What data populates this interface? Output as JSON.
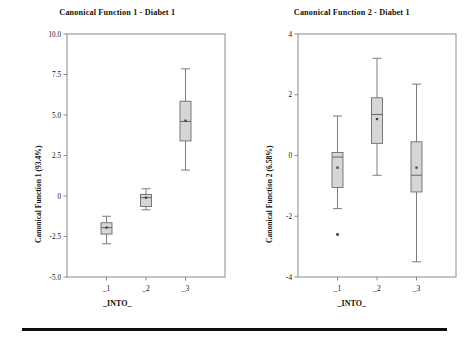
{
  "figure": {
    "footer_rule": "horizontal-rule"
  },
  "panels": [
    {
      "id": "panel-1",
      "title": "Canonical Function 1 - Diabet 1",
      "ylabel": "Canonical Function 1 (93.4%)",
      "xlabel": "_INTO_"
    },
    {
      "id": "panel-2",
      "title": "Canonical Function 2 - Diabet 1",
      "ylabel": "Canonical Function 2 (6.58%)",
      "xlabel": "_INTO_"
    }
  ],
  "chart_data": [
    {
      "type": "box",
      "title": "Canonical Function 1 - Diabet 1",
      "xlabel": "_INTO_",
      "ylabel": "Canonical Function 1 (93.4%)",
      "categories": [
        "_1",
        "_2",
        "_3"
      ],
      "ylim": [
        -5.0,
        10.0
      ],
      "yticks": [
        -5.0,
        -2.5,
        0,
        2.5,
        5.0,
        7.5,
        10.0
      ],
      "ytick_labels": [
        "-5.0",
        "-2.5",
        "0",
        "2.5",
        "5.0",
        "7.5",
        "10.0"
      ],
      "grid": false,
      "legend": "none",
      "boxes": [
        {
          "category": "_1",
          "whisker_low": -2.95,
          "q1": -2.35,
          "median": -1.95,
          "q3": -1.65,
          "whisker_high": -1.25,
          "mean": -1.95,
          "outliers": []
        },
        {
          "category": "_2",
          "whisker_low": -0.85,
          "q1": -0.65,
          "median": -0.1,
          "q3": 0.1,
          "whisker_high": 0.45,
          "mean": -0.1,
          "outliers": []
        },
        {
          "category": "_3",
          "whisker_low": 1.6,
          "q1": 3.4,
          "median": 4.6,
          "q3": 5.85,
          "whisker_high": 7.85,
          "mean": 4.65,
          "outliers": []
        }
      ]
    },
    {
      "type": "box",
      "title": "Canonical Function 2 - Diabet 1",
      "xlabel": "_INTO_",
      "ylabel": "Canonical Function 2 (6.58%)",
      "categories": [
        "_1",
        "_2",
        "_3"
      ],
      "ylim": [
        -4,
        4
      ],
      "yticks": [
        -4,
        -2,
        0,
        2,
        4
      ],
      "ytick_labels": [
        "-4",
        "-2",
        "0",
        "2",
        "4"
      ],
      "grid": false,
      "legend": "none",
      "boxes": [
        {
          "category": "_1",
          "whisker_low": -1.75,
          "q1": -1.05,
          "median": -0.05,
          "q3": 0.1,
          "whisker_high": 1.3,
          "mean": -0.4,
          "outliers": [
            -2.6
          ]
        },
        {
          "category": "_2",
          "whisker_low": -0.65,
          "q1": 0.4,
          "median": 1.35,
          "q3": 1.9,
          "whisker_high": 3.2,
          "mean": 1.2,
          "outliers": []
        },
        {
          "category": "_3",
          "whisker_low": -3.5,
          "q1": -1.2,
          "median": -0.65,
          "q3": 0.45,
          "whisker_high": 2.35,
          "mean": -0.4,
          "outliers": []
        }
      ]
    }
  ],
  "style": {
    "box_fill": "#d6d6d6",
    "line_color": "#6e6e6e",
    "axis_color": "#8a8a8a",
    "text_color": "#111111"
  }
}
